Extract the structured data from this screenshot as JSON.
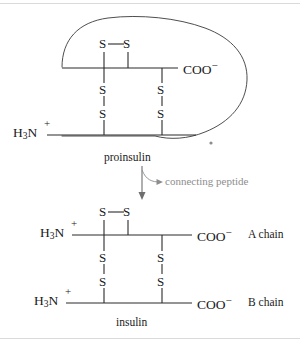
{
  "figure": {
    "background_color": "#ffffff",
    "line_color": "#2a2a2a",
    "annotation_color": "#8d8d8d",
    "rule_color": "#d8dadd"
  },
  "proinsulin": {
    "caption": "proinsulin",
    "n_terminus": {
      "main": "H",
      "sub": "3",
      "element": "N",
      "charge": "+"
    },
    "c_terminus": {
      "text": "COO",
      "charge": "−"
    },
    "disulfide_bonds": [
      {
        "name": "intrachain-A6-A11",
        "left_atom": "S",
        "right_atom": "S",
        "orientation": "horizontal"
      },
      {
        "name": "interchain-A7-B7",
        "top_atom": "S",
        "bottom_atom": "S",
        "orientation": "vertical"
      },
      {
        "name": "interchain-A20-B19",
        "top_atom": "S",
        "bottom_atom": "S",
        "orientation": "vertical"
      }
    ],
    "connecting_peptide_loop": "closed kidney-shaped loop enclosing the C-peptide"
  },
  "arrow": {
    "label": "connecting peptide",
    "direction": "down"
  },
  "insulin": {
    "caption": "insulin",
    "chains": [
      {
        "name": "A chain",
        "n_terminus": {
          "main": "H",
          "sub": "3",
          "element": "N",
          "charge": "+"
        },
        "c_terminus": {
          "text": "COO",
          "charge": "−"
        }
      },
      {
        "name": "B chain",
        "n_terminus": {
          "main": "H",
          "sub": "3",
          "element": "N",
          "charge": "+"
        },
        "c_terminus": {
          "text": "COO",
          "charge": "−"
        }
      }
    ],
    "disulfide_bonds": [
      {
        "name": "intrachain-A6-A11",
        "left_atom": "S",
        "right_atom": "S",
        "orientation": "horizontal"
      },
      {
        "name": "interchain-A7-B7",
        "top_atom": "S",
        "bottom_atom": "S",
        "orientation": "vertical"
      },
      {
        "name": "interchain-A20-B19",
        "top_atom": "S",
        "bottom_atom": "S",
        "orientation": "vertical"
      }
    ]
  },
  "atoms": {
    "sulfur": "S"
  }
}
